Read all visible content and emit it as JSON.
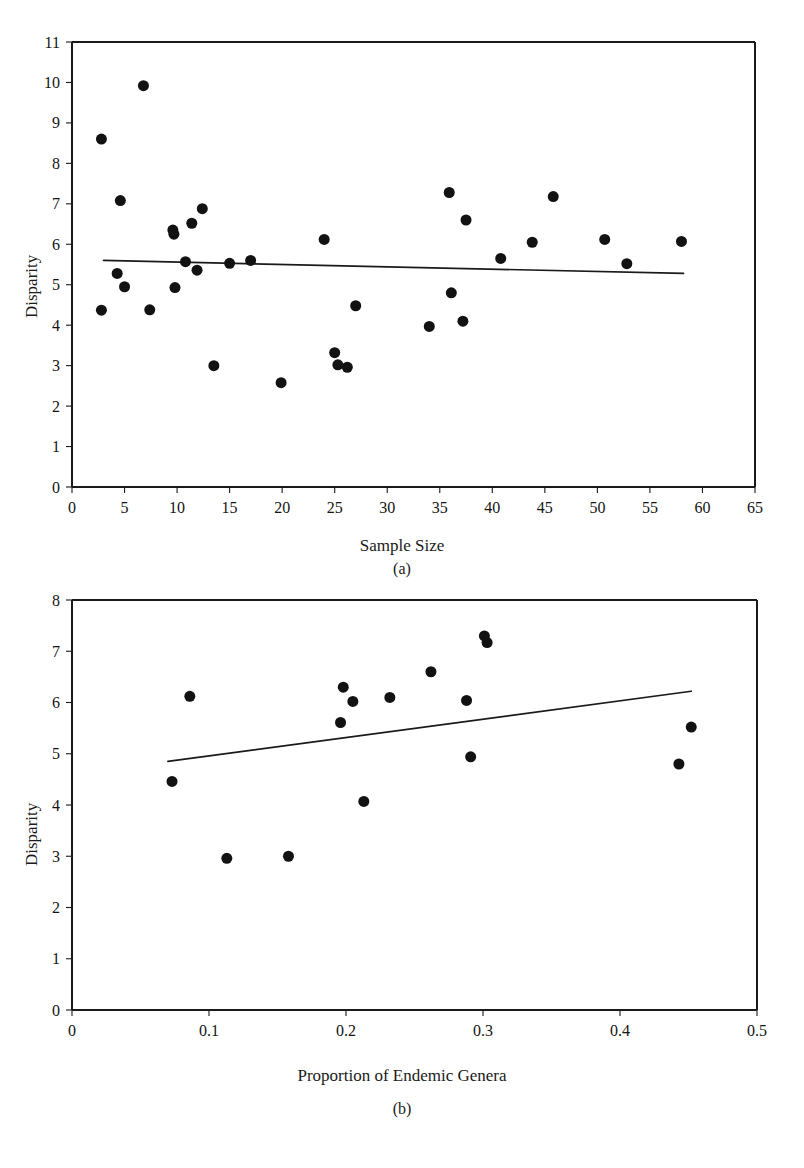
{
  "page": {
    "header_text": "",
    "background": "#ffffff",
    "ink": "#1a1a1a"
  },
  "figure": {
    "panels": [
      "a",
      "b"
    ],
    "caption_a": "(a)",
    "caption_b": "(b)"
  },
  "chart_data": [
    {
      "type": "scatter",
      "panel": "(a)",
      "title": "",
      "xlabel": "Sample Size",
      "ylabel": "Disparity",
      "xlim": [
        0,
        65
      ],
      "ylim": [
        0,
        11
      ],
      "xticks": [
        0,
        5,
        10,
        15,
        20,
        25,
        30,
        35,
        40,
        45,
        50,
        55,
        60,
        65
      ],
      "xtick_labels": [
        "0",
        "5",
        "10",
        "15",
        "20",
        "25",
        "30",
        "35",
        "40",
        "45",
        "50",
        "55",
        "60",
        "65"
      ],
      "yticks": [
        0,
        1,
        2,
        3,
        4,
        5,
        6,
        7,
        8,
        9,
        10,
        11
      ],
      "ytick_labels": [
        "0",
        "1",
        "2",
        "3",
        "4",
        "5",
        "6",
        "7",
        "8",
        "9",
        "10",
        "11"
      ],
      "grid": false,
      "legend": null,
      "marker": {
        "shape": "circle",
        "color": "#121212",
        "size_px": 11
      },
      "points": [
        {
          "x": 2.8,
          "y": 8.6
        },
        {
          "x": 2.8,
          "y": 4.37
        },
        {
          "x": 4.3,
          "y": 5.28
        },
        {
          "x": 4.6,
          "y": 7.08
        },
        {
          "x": 5.0,
          "y": 4.95
        },
        {
          "x": 6.8,
          "y": 9.92
        },
        {
          "x": 7.4,
          "y": 4.38
        },
        {
          "x": 9.6,
          "y": 6.35
        },
        {
          "x": 9.7,
          "y": 6.25
        },
        {
          "x": 9.8,
          "y": 4.93
        },
        {
          "x": 10.8,
          "y": 5.57
        },
        {
          "x": 11.4,
          "y": 6.52
        },
        {
          "x": 11.9,
          "y": 5.36
        },
        {
          "x": 12.4,
          "y": 6.88
        },
        {
          "x": 13.5,
          "y": 3.0
        },
        {
          "x": 15.0,
          "y": 5.53
        },
        {
          "x": 17.0,
          "y": 5.6
        },
        {
          "x": 19.9,
          "y": 2.58
        },
        {
          "x": 24.0,
          "y": 6.12
        },
        {
          "x": 25.0,
          "y": 3.32
        },
        {
          "x": 25.3,
          "y": 3.02
        },
        {
          "x": 26.2,
          "y": 2.96
        },
        {
          "x": 27.0,
          "y": 4.48
        },
        {
          "x": 34.0,
          "y": 3.97
        },
        {
          "x": 35.9,
          "y": 7.28
        },
        {
          "x": 36.1,
          "y": 4.8
        },
        {
          "x": 37.2,
          "y": 4.1
        },
        {
          "x": 37.5,
          "y": 6.6
        },
        {
          "x": 40.8,
          "y": 5.65
        },
        {
          "x": 43.8,
          "y": 6.05
        },
        {
          "x": 45.8,
          "y": 7.18
        },
        {
          "x": 50.7,
          "y": 6.12
        },
        {
          "x": 52.8,
          "y": 5.52
        },
        {
          "x": 58.0,
          "y": 6.07
        }
      ],
      "fit_line": {
        "x0": 3.0,
        "y0": 5.6,
        "x1": 58.2,
        "y1": 5.28,
        "style": "solid",
        "color": "#1a1a1a"
      }
    },
    {
      "type": "scatter",
      "panel": "(b)",
      "title": "",
      "xlabel": "Proportion of Endemic Genera",
      "ylabel": "Disparity",
      "xlim": [
        0,
        0.5
      ],
      "ylim": [
        0,
        8
      ],
      "xticks": [
        0,
        0.1,
        0.2,
        0.3,
        0.4,
        0.5
      ],
      "xtick_labels": [
        "0",
        "0.1",
        "0.2",
        "0.3",
        "0.4",
        "0.5"
      ],
      "yticks": [
        0,
        1,
        2,
        3,
        4,
        5,
        6,
        7,
        8
      ],
      "ytick_labels": [
        "0",
        "1",
        "2",
        "3",
        "4",
        "5",
        "6",
        "7",
        "8"
      ],
      "grid": false,
      "legend": null,
      "marker": {
        "shape": "circle",
        "color": "#121212",
        "size_px": 11
      },
      "points": [
        {
          "x": 0.073,
          "y": 4.46
        },
        {
          "x": 0.086,
          "y": 6.12
        },
        {
          "x": 0.113,
          "y": 2.96
        },
        {
          "x": 0.158,
          "y": 3.0
        },
        {
          "x": 0.196,
          "y": 5.61
        },
        {
          "x": 0.198,
          "y": 6.3
        },
        {
          "x": 0.205,
          "y": 6.02
        },
        {
          "x": 0.213,
          "y": 4.07
        },
        {
          "x": 0.232,
          "y": 6.1
        },
        {
          "x": 0.262,
          "y": 6.6
        },
        {
          "x": 0.288,
          "y": 6.04
        },
        {
          "x": 0.291,
          "y": 4.94
        },
        {
          "x": 0.301,
          "y": 7.3
        },
        {
          "x": 0.303,
          "y": 7.17
        },
        {
          "x": 0.443,
          "y": 4.8
        },
        {
          "x": 0.452,
          "y": 5.52
        }
      ],
      "fit_line": {
        "x0": 0.07,
        "y0": 4.85,
        "x1": 0.452,
        "y1": 6.22,
        "style": "solid",
        "color": "#1a1a1a"
      }
    }
  ]
}
